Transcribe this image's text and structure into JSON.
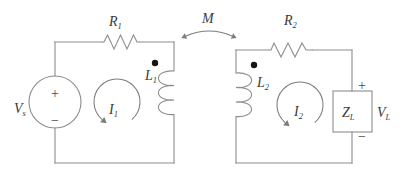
{
  "diagram": {
    "kind": "linear-transformer-circuit",
    "colors": {
      "wire": "#8d8d8d",
      "text": "#3a3a3a",
      "dot": "#161616",
      "background": "#ffffff"
    },
    "source": {
      "symbol": "V",
      "subscript": "s",
      "plus": "+",
      "minus": "−"
    },
    "resistor_primary": {
      "symbol": "R",
      "subscript": "1"
    },
    "resistor_secondary": {
      "symbol": "R",
      "subscript": "2"
    },
    "inductor_primary": {
      "symbol": "L",
      "subscript": "1"
    },
    "inductor_secondary": {
      "symbol": "L",
      "subscript": "2"
    },
    "mesh_current_primary": {
      "symbol": "I",
      "subscript": "1"
    },
    "mesh_current_secondary": {
      "symbol": "I",
      "subscript": "2"
    },
    "mutual_inductance": {
      "symbol": "M",
      "subscript": ""
    },
    "load_impedance": {
      "symbol": "Z",
      "subscript": "L"
    },
    "load_voltage": {
      "symbol": "V",
      "subscript": "L",
      "plus": "+",
      "minus": "−"
    }
  }
}
